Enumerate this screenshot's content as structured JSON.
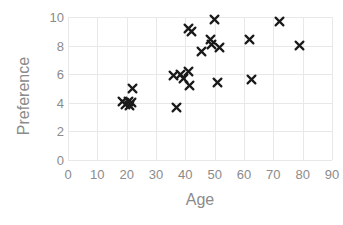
{
  "chart_data": {
    "type": "scatter",
    "title": "",
    "xlabel": "Age",
    "ylabel": "Preference",
    "xlim": [
      0,
      90
    ],
    "ylim": [
      0,
      10
    ],
    "xticks": [
      0,
      10,
      20,
      30,
      40,
      50,
      60,
      70,
      80,
      90
    ],
    "yticks": [
      0,
      2,
      4,
      6,
      8,
      10
    ],
    "grid": true,
    "legend": "none",
    "marker": "x",
    "marker_color": "#1a1a1a",
    "grid_color": "#e8e8e8",
    "tick_label_color": "#8b8b8b",
    "axis_title_color": "#8b8b8b",
    "background_color": "#ffffff",
    "series": [
      {
        "name": "Preference by Age",
        "points": [
          {
            "x": 18.5,
            "y": 4.1
          },
          {
            "x": 19.5,
            "y": 3.9
          },
          {
            "x": 20.5,
            "y": 4.1
          },
          {
            "x": 21.0,
            "y": 3.8
          },
          {
            "x": 21.5,
            "y": 4.0
          },
          {
            "x": 22.0,
            "y": 5.0
          },
          {
            "x": 36.0,
            "y": 5.9
          },
          {
            "x": 37.0,
            "y": 3.7
          },
          {
            "x": 38.5,
            "y": 6.0
          },
          {
            "x": 39.5,
            "y": 5.7
          },
          {
            "x": 41.0,
            "y": 6.2
          },
          {
            "x": 41.0,
            "y": 9.2
          },
          {
            "x": 41.5,
            "y": 5.2
          },
          {
            "x": 42.0,
            "y": 9.0
          },
          {
            "x": 45.5,
            "y": 7.6
          },
          {
            "x": 48.5,
            "y": 8.4
          },
          {
            "x": 49.0,
            "y": 8.1
          },
          {
            "x": 50.0,
            "y": 9.8
          },
          {
            "x": 51.0,
            "y": 5.4
          },
          {
            "x": 51.5,
            "y": 7.9
          },
          {
            "x": 62.0,
            "y": 8.4
          },
          {
            "x": 62.5,
            "y": 5.6
          },
          {
            "x": 72.0,
            "y": 9.7
          },
          {
            "x": 79.0,
            "y": 8.0
          }
        ]
      }
    ]
  }
}
